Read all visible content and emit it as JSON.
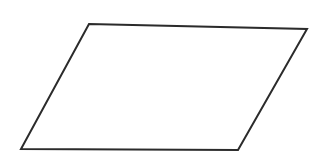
{
  "figure": {
    "shape_name": "parallelogram",
    "canvas": {
      "width": 322,
      "height": 163,
      "background_color": "#ffffff"
    },
    "style": {
      "stroke_color": "#2b2b2b",
      "stroke_width": 2,
      "fill_color": "#ffffff"
    },
    "vertices": [
      {
        "label": "top-left",
        "x": 89,
        "y": 24
      },
      {
        "label": "top-right",
        "x": 307,
        "y": 29
      },
      {
        "label": "bottom-right",
        "x": 238,
        "y": 150
      },
      {
        "label": "bottom-left",
        "x": 21,
        "y": 149
      }
    ],
    "points_attr": "89,24 307,29 238,150 21,149",
    "edges": [
      {
        "name": "top-edge",
        "from": "top-left",
        "to": "top-right"
      },
      {
        "name": "right-edge",
        "from": "top-right",
        "to": "bottom-right"
      },
      {
        "name": "bottom-edge",
        "from": "bottom-right",
        "to": "bottom-left"
      },
      {
        "name": "left-edge",
        "from": "bottom-left",
        "to": "top-left"
      }
    ]
  }
}
